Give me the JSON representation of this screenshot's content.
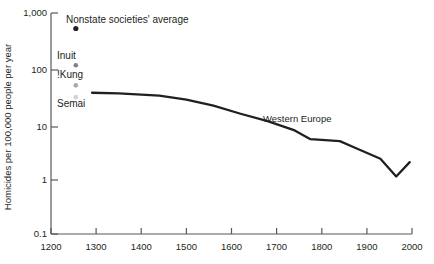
{
  "chart_data": {
    "type": "scatter",
    "title": "",
    "xlabel": "",
    "ylabel": "Homicides per 100,000 people per year",
    "xlim": [
      1200,
      2000
    ],
    "ylim": [
      0.1,
      1000
    ],
    "yscale": "log",
    "grid": false,
    "legend": "none",
    "xticks": [
      1200,
      1300,
      1400,
      1500,
      1600,
      1700,
      1800,
      1900,
      2000
    ],
    "xtick_labels": [
      "1200",
      "1300",
      "1400",
      "1500",
      "1600",
      "1700",
      "1800",
      "1900",
      "2000"
    ],
    "yticks": [
      0.1,
      1,
      10,
      100,
      1000
    ],
    "ytick_labels": [
      "0.1",
      "1",
      "10",
      "100",
      "1,000"
    ],
    "series": [
      {
        "name": "Western Europe",
        "type": "line",
        "color": "#231f20",
        "annotation": "Western Europe",
        "x": [
          1291,
          1350,
          1440,
          1500,
          1560,
          1620,
          1680,
          1740,
          1775,
          1840,
          1875,
          1930,
          1965,
          1995
        ],
        "values": [
          36,
          35,
          32,
          27,
          21,
          15,
          11,
          7.5,
          5.2,
          4.8,
          3.6,
          2.3,
          1.1,
          2.0
        ]
      },
      {
        "name": "Nonstate societies' average",
        "type": "point",
        "color": "#231f20",
        "x": 1255,
        "value": 524
      },
      {
        "name": "Inuit",
        "type": "point",
        "color": "#808285",
        "x": 1255,
        "value": 113
      },
      {
        "name": "!Kung",
        "type": "point",
        "color": "#a7a9ac",
        "x": 1255,
        "value": 49
      },
      {
        "name": "Semai",
        "type": "point",
        "color": "#d1d3d4",
        "x": 1255,
        "value": 30
      }
    ],
    "point_labels": [
      "Nonstate societies' average",
      "Inuit",
      "!Kung",
      "Semai"
    ]
  }
}
